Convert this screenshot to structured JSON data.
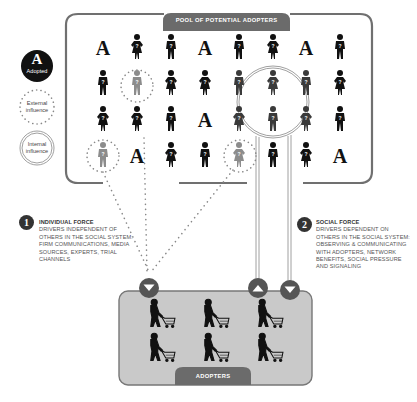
{
  "pool": {
    "tab_label": "POOL OF POTENTIAL ADOPTERS",
    "grid": [
      [
        {
          "t": "A",
          "c": "black"
        },
        {
          "t": "F",
          "c": "black"
        },
        {
          "t": "M",
          "c": "black"
        },
        {
          "t": "A",
          "c": "black"
        },
        {
          "t": "M",
          "c": "black"
        },
        {
          "t": "F",
          "c": "black"
        },
        {
          "t": "A",
          "c": "black"
        },
        {
          "t": "M",
          "c": "black"
        }
      ],
      [
        {
          "t": "M",
          "c": "black"
        },
        {
          "t": "M",
          "c": "gray",
          "ext": true
        },
        {
          "t": "F",
          "c": "black"
        },
        {
          "t": "F",
          "c": "black"
        },
        {
          "t": "M",
          "c": "dark"
        },
        {
          "t": "F",
          "c": "dark"
        },
        {
          "t": "M",
          "c": "dark"
        },
        {
          "t": "F",
          "c": "black"
        }
      ],
      [
        {
          "t": "F",
          "c": "black"
        },
        {
          "t": "F",
          "c": "black"
        },
        {
          "t": "M",
          "c": "black"
        },
        {
          "t": "A",
          "c": "black"
        },
        {
          "t": "F",
          "c": "dark"
        },
        {
          "t": "M",
          "c": "dark"
        },
        {
          "t": "F",
          "c": "dark"
        },
        {
          "t": "M",
          "c": "black"
        }
      ],
      [
        {
          "t": "M",
          "c": "gray",
          "ext": true
        },
        {
          "t": "A",
          "c": "black"
        },
        {
          "t": "F",
          "c": "black"
        },
        {
          "t": "M",
          "c": "black"
        },
        {
          "t": "F",
          "c": "gray",
          "ext": true
        },
        {
          "t": "M",
          "c": "black"
        },
        {
          "t": "F",
          "c": "black"
        },
        {
          "t": "A",
          "c": "black"
        }
      ]
    ]
  },
  "legend": {
    "adopted_letter": "A",
    "adopted_label": "Adopted",
    "external_line1": "External",
    "external_line2": "influence",
    "internal_line1": "Internal",
    "internal_line2": "influence"
  },
  "individual_force": {
    "number": "1",
    "title": "INDIVIDUAL FORCE",
    "lines": [
      "DRIVERS INDEPENDENT OF",
      "OTHERS IN THE SOCIAL SYSTEM:",
      "FIRM COMMUNICATIONS, MEDIA",
      "SOURCES, EXPERTS, TRIAL",
      "CHANNELS"
    ]
  },
  "social_force": {
    "number": "2",
    "title": "SOCIAL FORCE",
    "lines": [
      "DRIVERS DEPENDENT ON",
      "OTHERS IN THE SOCIAL SYSTEM:",
      "OBSERVING & COMMUNICATING",
      "WITH ADOPTERS, NETWORK",
      "BENEFITS, SOCIAL PRESSURE",
      "AND SIGNALING"
    ]
  },
  "adopters": {
    "tab_label": "ADOPTERS",
    "count": 6
  },
  "colors": {
    "frame": "#6e6e6e",
    "tab": "#6b6b6b",
    "adopter_box": "#c9c9c9",
    "button": "#555555",
    "dots": "#888888",
    "figure_black": "#111111",
    "figure_dark": "#3a3a3a",
    "figure_gray": "#8c8c8c"
  }
}
